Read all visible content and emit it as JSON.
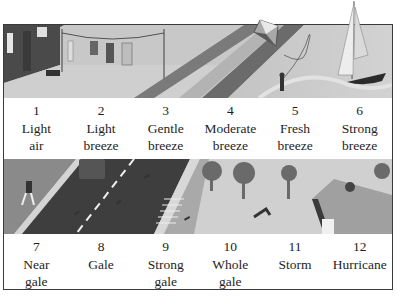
{
  "figure": {
    "palette": {
      "border": "#3a3a3a",
      "text": "#1e1e1e",
      "image_light": "#c9c9c9",
      "image_dark": "#5a5a5a"
    }
  },
  "scale_top": [
    {
      "number": "1",
      "line1": "Light",
      "line2": "air",
      "scene": "washing-line"
    },
    {
      "number": "2",
      "line1": "Light",
      "line2": "breeze",
      "scene": "washing-line"
    },
    {
      "number": "3",
      "line1": "Gentle",
      "line2": "breeze",
      "scene": "fence"
    },
    {
      "number": "4",
      "line1": "Moderate",
      "line2": "breeze",
      "scene": "path"
    },
    {
      "number": "5",
      "line1": "Fresh",
      "line2": "breeze",
      "scene": "kite"
    },
    {
      "number": "6",
      "line1": "Strong",
      "line2": "breeze",
      "scene": "sailboat"
    }
  ],
  "scale_bottom": [
    {
      "number": "7",
      "line1": "Near",
      "line2": "gale",
      "scene": "person-walking"
    },
    {
      "number": "8",
      "line1": "Gale",
      "line2": "",
      "scene": "road"
    },
    {
      "number": "9",
      "line1": "Strong",
      "line2": "gale",
      "scene": "steps"
    },
    {
      "number": "10",
      "line1": "Whole",
      "line2": "gale",
      "scene": "trees-falling"
    },
    {
      "number": "11",
      "line1": "Storm",
      "line2": "",
      "scene": "bare-tree"
    },
    {
      "number": "12",
      "line1": "Hurricane",
      "line2": "",
      "scene": "roof-damage"
    }
  ]
}
